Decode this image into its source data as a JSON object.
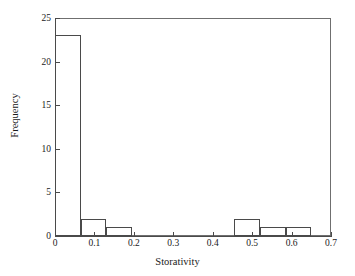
{
  "chart_data": {
    "type": "bar",
    "title": "",
    "subtitle": "",
    "xlabel": "Storativity",
    "ylabel": "Frequency",
    "xlim": [
      0,
      0.7
    ],
    "ylim": [
      0,
      25
    ],
    "grid": false,
    "legend": null,
    "x_ticks": [
      "0",
      "0.1",
      "0.2",
      "0.3",
      "0.4",
      "0.5",
      "0.6",
      "0.7"
    ],
    "x_tick_values": [
      0,
      0.1,
      0.2,
      0.3,
      0.4,
      0.5,
      0.6,
      0.7
    ],
    "y_ticks": [
      "0",
      "5",
      "10",
      "15",
      "20",
      "25"
    ],
    "y_tick_values": [
      0,
      5,
      10,
      15,
      20,
      25
    ],
    "bin_width": 0.065,
    "bins": [
      {
        "x0": 0.0,
        "x1": 0.065,
        "value": 23
      },
      {
        "x0": 0.065,
        "x1": 0.13,
        "value": 2
      },
      {
        "x0": 0.13,
        "x1": 0.195,
        "value": 1
      },
      {
        "x0": 0.455,
        "x1": 0.52,
        "value": 2
      },
      {
        "x0": 0.52,
        "x1": 0.585,
        "value": 1
      },
      {
        "x0": 0.585,
        "x1": 0.65,
        "value": 1
      }
    ],
    "categories": [
      "0-0.065",
      "0.065-0.13",
      "0.13-0.195",
      "0.455-0.52",
      "0.52-0.585",
      "0.585-0.65"
    ],
    "values": [
      23,
      2,
      1,
      2,
      1,
      1
    ],
    "colors": {
      "bar_fill": "transparent",
      "bar_edge": "#4a4a4a",
      "frame": "#6f6f6f",
      "text": "#1a1a1a",
      "background": "#ffffff"
    }
  }
}
